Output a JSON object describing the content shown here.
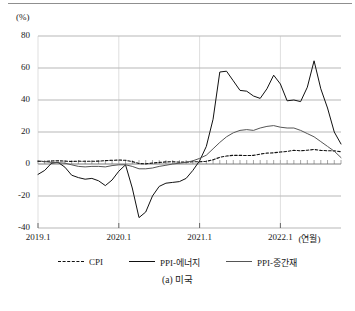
{
  "figure": {
    "unit_label": "(%)",
    "caption": "(a) 미국",
    "xaxis_unit": "(연월)"
  },
  "chart_data": {
    "type": "line",
    "title": "",
    "subtitle": "",
    "xlabel": "(연월)",
    "ylabel": "(%)",
    "ylim": [
      -40,
      80
    ],
    "yticks": [
      -40,
      -20,
      0,
      20,
      40,
      60,
      80
    ],
    "ytick_labels": [
      "-40",
      "-20",
      "0",
      "20",
      "40",
      "60",
      "80"
    ],
    "grid": "horizontal",
    "legend_position": "below-axes",
    "xlim": [
      "2019.1",
      "2022.10"
    ],
    "xticks": [
      "2019.1",
      "2020.1",
      "2021.1",
      "2022.1"
    ],
    "xtick_labels": [
      "2019.1",
      "2020.1",
      "2021.1",
      "2022.1"
    ],
    "x": [
      "2019.1",
      "2019.2",
      "2019.3",
      "2019.4",
      "2019.5",
      "2019.6",
      "2019.7",
      "2019.8",
      "2019.9",
      "2019.10",
      "2019.11",
      "2019.12",
      "2020.1",
      "2020.2",
      "2020.3",
      "2020.4",
      "2020.5",
      "2020.6",
      "2020.7",
      "2020.8",
      "2020.9",
      "2020.10",
      "2020.11",
      "2020.12",
      "2021.1",
      "2021.2",
      "2021.3",
      "2021.4",
      "2021.5",
      "2021.6",
      "2021.7",
      "2021.8",
      "2021.9",
      "2021.10",
      "2021.11",
      "2021.12",
      "2022.1",
      "2022.2",
      "2022.3",
      "2022.4",
      "2022.5",
      "2022.6",
      "2022.7",
      "2022.8",
      "2022.9",
      "2022.10"
    ],
    "series": [
      {
        "name": "CPI",
        "style": "dashed",
        "color": "#111111",
        "values": [
          1.6,
          1.5,
          1.9,
          2.0,
          1.8,
          1.6,
          1.8,
          1.7,
          1.7,
          1.8,
          2.1,
          2.3,
          2.5,
          2.3,
          1.5,
          0.3,
          0.1,
          0.6,
          1.0,
          1.3,
          1.4,
          1.2,
          1.2,
          1.4,
          1.4,
          1.7,
          2.6,
          4.2,
          5.0,
          5.4,
          5.4,
          5.3,
          5.4,
          6.2,
          6.8,
          7.0,
          7.5,
          7.9,
          8.5,
          8.3,
          8.6,
          9.1,
          8.5,
          8.3,
          8.2,
          7.7
        ]
      },
      {
        "name": "PPI-에너지",
        "style": "solid",
        "color": "#111111",
        "values": [
          -6.5,
          -4.0,
          0.5,
          1.0,
          -2.0,
          -7.0,
          -8.5,
          -9.5,
          -9.0,
          -10.5,
          -13.5,
          -10.0,
          -4.5,
          -0.5,
          -15.0,
          -33.5,
          -30.0,
          -20.0,
          -14.0,
          -12.0,
          -11.5,
          -11.0,
          -9.0,
          -4.0,
          2.0,
          11.0,
          28.0,
          57.5,
          58.0,
          52.0,
          46.0,
          45.5,
          42.5,
          41.0,
          47.0,
          55.5,
          50.0,
          39.5,
          40.0,
          39.0,
          48.0,
          64.5,
          47.0,
          35.0,
          20.0,
          12.5
        ]
      },
      {
        "name": "PPI-중간재",
        "style": "solid",
        "color": "#555555",
        "values": [
          2.0,
          1.5,
          1.0,
          0.8,
          0.5,
          -0.5,
          -1.5,
          -1.8,
          -1.5,
          -1.5,
          -1.8,
          -1.0,
          -0.5,
          -0.5,
          -1.5,
          -3.0,
          -3.0,
          -2.5,
          -1.5,
          -0.8,
          0.0,
          0.5,
          1.0,
          2.0,
          3.5,
          5.5,
          9.5,
          13.5,
          17.0,
          19.5,
          21.0,
          21.5,
          21.0,
          22.5,
          23.5,
          24.0,
          23.0,
          22.5,
          22.5,
          21.0,
          19.0,
          17.0,
          14.0,
          11.0,
          8.0,
          4.0
        ]
      }
    ]
  },
  "legend": [
    {
      "label": "CPI",
      "style": "dashed",
      "color": "#111111"
    },
    {
      "label": "PPI-에너지",
      "style": "solid",
      "color": "#111111"
    },
    {
      "label": "PPI-중간재",
      "style": "solid",
      "color": "#555555"
    }
  ]
}
